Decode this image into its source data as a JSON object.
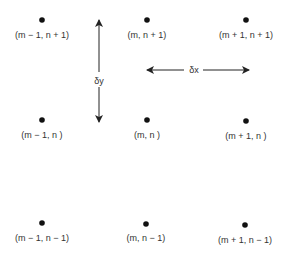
{
  "diagram": {
    "points": [
      {
        "x": 42,
        "y": 20,
        "label": "(m − 1, n + 1)",
        "lx": 42,
        "ly": 38
      },
      {
        "x": 147,
        "y": 20,
        "label": "(m, n + 1)",
        "lx": 147,
        "ly": 38
      },
      {
        "x": 246,
        "y": 20,
        "label": "(m + 1, n + 1)",
        "lx": 246,
        "ly": 38
      },
      {
        "x": 42,
        "y": 120,
        "label": "(m − 1, n )",
        "lx": 42,
        "ly": 138
      },
      {
        "x": 147,
        "y": 120,
        "label": "(m, n )",
        "lx": 147,
        "ly": 138
      },
      {
        "x": 246,
        "y": 121,
        "label": "(m + 1, n )",
        "lx": 246,
        "ly": 139
      },
      {
        "x": 42,
        "y": 223,
        "label": "(m − 1, n − 1)",
        "lx": 42,
        "ly": 241
      },
      {
        "x": 146,
        "y": 224,
        "label": "(m, n − 1)",
        "lx": 146,
        "ly": 241
      },
      {
        "x": 245,
        "y": 225,
        "label": "(m + 1, n − 1)",
        "lx": 245,
        "ly": 243
      }
    ],
    "dy_label": "δy",
    "dx_label": "δx",
    "colors": {
      "dot": "#111111",
      "text": "#333333",
      "arrow": "#222222"
    }
  }
}
